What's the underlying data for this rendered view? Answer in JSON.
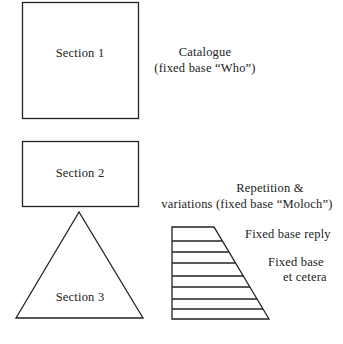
{
  "diagram": {
    "stroke_color": "#222222",
    "background": "#ffffff",
    "shapes": {
      "section1": {
        "shape": "square",
        "label": "Section 1"
      },
      "section2": {
        "shape": "rectangle",
        "label": "Section 2"
      },
      "section3": {
        "shape": "triangle",
        "label": "Section 3"
      },
      "ladder": {
        "shape": "trapezoid-with-horizontal-lines",
        "line_count": 9
      }
    },
    "annotations": {
      "catalogue_line1": "Catalogue",
      "catalogue_line2": "(fixed base “Who”)",
      "repetition_line1": "Repetition &",
      "repetition_line2": "variations (fixed base “Moloch”)",
      "fixed_base_reply": "Fixed base reply",
      "fixed_base_line1": "Fixed base",
      "fixed_base_line2": "et cetera"
    }
  }
}
